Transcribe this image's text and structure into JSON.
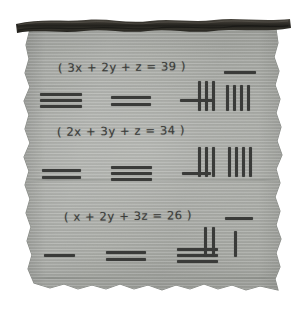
{
  "artifact": {
    "kind": "counting-rod-scroll",
    "medium": "parchment",
    "paper_color": "#a8aba5",
    "ink_color": "#3a3b39",
    "rod_color": "#2b2a26",
    "background_color": "#ffffff"
  },
  "top_rod": {
    "label": "wooden scroll rod"
  },
  "rows": [
    {
      "equation": "( 3x + 2y + z = 39 )",
      "coefficients": [
        {
          "variable": "x",
          "value": 3,
          "bars": 3
        },
        {
          "variable": "y",
          "value": 2,
          "bars": 2
        },
        {
          "variable": "z",
          "value": 1,
          "bars": 1
        }
      ],
      "constant": 39,
      "rod_numeral": [
        {
          "digit": 3,
          "place": "tens",
          "bar": false,
          "rods": 3
        },
        {
          "digit": 9,
          "place": "units",
          "bar": true,
          "rods": 4
        }
      ]
    },
    {
      "equation": "( 2x + 3y + z = 34 )",
      "coefficients": [
        {
          "variable": "x",
          "value": 2,
          "bars": 2
        },
        {
          "variable": "y",
          "value": 3,
          "bars": 3
        },
        {
          "variable": "z",
          "value": 1,
          "bars": 1
        }
      ],
      "constant": 34,
      "rod_numeral": [
        {
          "digit": 3,
          "place": "tens",
          "bar": false,
          "rods": 3
        },
        {
          "digit": 4,
          "place": "units",
          "bar": false,
          "rods": 4
        }
      ]
    },
    {
      "equation": "( x + 2y + 3z = 26 )",
      "coefficients": [
        {
          "variable": "x",
          "value": 1,
          "bars": 1
        },
        {
          "variable": "y",
          "value": 2,
          "bars": 2
        },
        {
          "variable": "z",
          "value": 3,
          "bars": 3
        }
      ],
      "constant": 26,
      "rod_numeral": [
        {
          "digit": 2,
          "place": "tens",
          "bar": false,
          "rods": 2
        },
        {
          "digit": 6,
          "place": "units",
          "bar": true,
          "rods": 1
        }
      ]
    }
  ]
}
